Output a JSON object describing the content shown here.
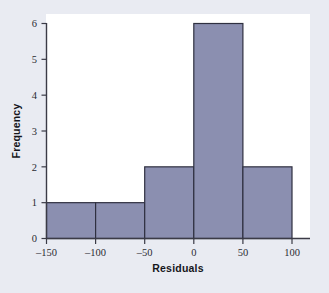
{
  "chart_data": {
    "type": "bar",
    "title": "",
    "subtitle": "",
    "xlabel": "Residuals",
    "ylabel": "Frequency",
    "xlim": [
      -150,
      100
    ],
    "ylim": [
      0,
      6
    ],
    "grid": false,
    "legend": "none",
    "bin_width": 50,
    "bin_edges": [
      -150,
      -100,
      -50,
      0,
      50,
      100
    ],
    "categories": [
      "-150 to -100",
      "-100 to -50",
      "-50 to 0",
      "0 to 50",
      "50 to 100"
    ],
    "values": [
      1,
      1,
      2,
      6,
      2
    ],
    "bars": [
      {
        "label": "-150 to -100",
        "left": -150,
        "right": -100,
        "value": 1
      },
      {
        "label": "-100 to -50",
        "left": -100,
        "right": -50,
        "value": 1
      },
      {
        "label": "-50 to 0",
        "left": -50,
        "right": 0,
        "value": 2
      },
      {
        "label": "0 to 50",
        "left": 0,
        "right": 50,
        "value": 6
      },
      {
        "label": "50 to 100",
        "left": 50,
        "right": 100,
        "value": 2
      }
    ],
    "xticks": [
      -150,
      -100,
      -50,
      0,
      50,
      100
    ],
    "xtick_labels": [
      "–150",
      "–100",
      "–50",
      "0",
      "50",
      "100"
    ],
    "yticks": [
      0,
      1,
      2,
      3,
      4,
      5,
      6
    ],
    "ytick_labels": [
      "0",
      "1",
      "2",
      "3",
      "4",
      "5",
      "6"
    ],
    "total_count": 12,
    "colors": {
      "bar_fill": "#8b8fb0",
      "bar_edge": "#2f3040",
      "axis": "#3b3b46",
      "plot_background": "#ffffff",
      "figure_background": "#e9ebf2",
      "text": "#16161c"
    }
  }
}
